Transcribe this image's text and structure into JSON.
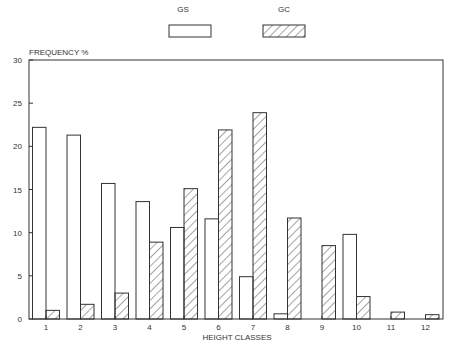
{
  "chart_data": {
    "type": "bar",
    "title": "",
    "xlabel": "HEIGHT CLASSES",
    "ylabel": "FREQUENCY %",
    "ylim": [
      0,
      30
    ],
    "yticks": [
      0,
      5,
      10,
      15,
      20,
      25,
      30
    ],
    "grid": false,
    "legend_position": "top-center",
    "categories": [
      "1",
      "2",
      "3",
      "4",
      "5",
      "6",
      "7",
      "8",
      "9",
      "10",
      "11",
      "12"
    ],
    "series": [
      {
        "name": "GS",
        "pattern": "empty",
        "values": [
          22.2,
          21.3,
          15.7,
          13.6,
          10.6,
          11.6,
          4.9,
          0.6,
          0,
          9.8,
          0,
          0
        ]
      },
      {
        "name": "GC",
        "pattern": "hatched",
        "values": [
          1.0,
          1.7,
          3.0,
          8.9,
          15.1,
          21.9,
          23.9,
          11.7,
          8.5,
          2.6,
          0.8,
          0.5
        ]
      }
    ]
  },
  "colors": {
    "stroke": "#333333",
    "background": "#ffffff"
  }
}
